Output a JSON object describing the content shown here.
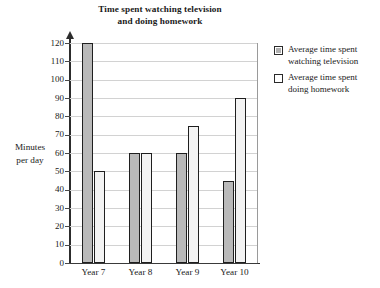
{
  "chart_data": {
    "type": "bar",
    "title": "Time spent watching television and doing homework",
    "title_lines": [
      "Time spent watching television",
      "and doing homework"
    ],
    "xlabel": "",
    "ylabel": "Minutes per day",
    "ylabel_lines": [
      "Minutes",
      "per day"
    ],
    "categories": [
      "Year 7",
      "Year 8",
      "Year 9",
      "Year 10"
    ],
    "series": [
      {
        "name": "Average time spent watching television",
        "name_lines": [
          "Average time spent",
          "watching television"
        ],
        "color": "#b9b9b9",
        "values": [
          120,
          60,
          60,
          45
        ]
      },
      {
        "name": "Average time spent doing homework",
        "name_lines": [
          "Average time spent",
          "doing homework"
        ],
        "color": "#f3f3f3",
        "values": [
          50,
          60,
          75,
          90
        ]
      }
    ],
    "ylim": [
      0,
      120
    ],
    "ytick_step": 10,
    "yticks": [
      0,
      10,
      20,
      30,
      40,
      50,
      60,
      70,
      80,
      90,
      100,
      110,
      120
    ],
    "ytick_labels": [
      "0",
      "10",
      "20",
      "30",
      "40",
      "50",
      "60",
      "70",
      "80",
      "90",
      "100",
      "110",
      "120"
    ],
    "grid": true,
    "grid_axis": "y",
    "legend_position": "right",
    "axis_color": "#2c2c2c",
    "grid_color": "#d2d2d2",
    "bar_edge_color": "#1f1f1f"
  }
}
